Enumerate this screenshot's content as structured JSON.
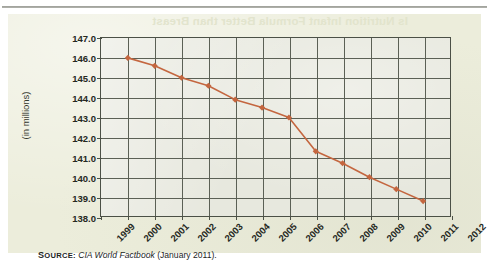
{
  "page": {
    "bleed_through_title": "Is Nutrition Infant Formula Better than Breast",
    "panel_color": "#eceddb"
  },
  "source": {
    "label_small_caps": "S",
    "label_rest": "OURCE",
    "label_colon": ":",
    "work": "CIA World Factbook",
    "rest": "(January 2011)."
  },
  "chart_data": {
    "type": "line",
    "title": "",
    "xlabel": "",
    "ylabel": "(in millions)",
    "x": [
      2000,
      2001,
      2002,
      2003,
      2004,
      2005,
      2006,
      2007,
      2008,
      2009,
      2010,
      2011
    ],
    "values": [
      146.0,
      145.6,
      145.0,
      144.6,
      143.9,
      143.5,
      143.0,
      141.3,
      140.7,
      140.0,
      139.4,
      138.8
    ],
    "xticks": [
      "1999",
      "2000",
      "2001",
      "2002",
      "2003",
      "2004",
      "2005",
      "2006",
      "2007",
      "2008",
      "2009",
      "2010",
      "2011",
      "2012"
    ],
    "yticks": [
      "147.0",
      "146.0",
      "145.0",
      "144.0",
      "143.0",
      "142.0",
      "141.0",
      "140.0",
      "139.0",
      "138.0"
    ],
    "xlim": [
      1999,
      2012
    ],
    "ylim": [
      138.0,
      147.0
    ],
    "grid": true,
    "legend": "none",
    "series_color": "#c4663f",
    "marker": "diamond",
    "gridline_color": "#5b6055",
    "plot_background": "#e7e8de"
  }
}
